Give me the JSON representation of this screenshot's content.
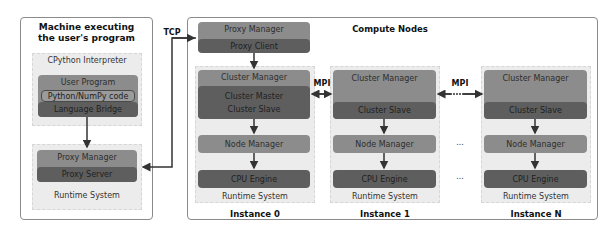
{
  "machine": {
    "title_line1": "Machine executing",
    "title_line2": "the user's program",
    "interpreter_label": "CPython Interpreter",
    "user_program": {
      "label": "User Program",
      "code_label": "Python/NumPy code",
      "bridge_label": "Language Bridge"
    },
    "runtime": {
      "proxy_manager": "Proxy Manager",
      "proxy_server": "Proxy Server",
      "label": "Runtime System"
    }
  },
  "links": {
    "tcp": "TCP",
    "mpi_left": "MPI",
    "mpi_right": "MPI",
    "ellipsis": "..."
  },
  "compute": {
    "title": "Compute Nodes",
    "instances": [
      {
        "label": "Instance 0",
        "proxy_manager": "Proxy Manager",
        "proxy_client": "Proxy Client",
        "cluster_manager": "Cluster Manager",
        "cluster_role_1": "Cluster Master",
        "cluster_role_2": "Cluster Slave",
        "node_manager": "Node Manager",
        "engine": "CPU Engine",
        "runtime_label": "Runtime System"
      },
      {
        "label": "Instance 1",
        "cluster_manager": "Cluster Manager",
        "cluster_role_1": "Cluster Slave",
        "node_manager": "Node Manager",
        "engine": "CPU Engine",
        "runtime_label": "Runtime System"
      },
      {
        "label": "Instance N",
        "cluster_manager": "Cluster Manager",
        "cluster_role_1": "Cluster Slave",
        "node_manager": "Node Manager",
        "engine": "CPU Engine",
        "runtime_label": "Runtime System"
      }
    ]
  },
  "colors": {
    "block_mid": "#8c8c8c",
    "block_dark": "#5e5e5e",
    "runtime_bg": "#ececec",
    "border": "#8a8a8a",
    "arrow": "#333333"
  }
}
